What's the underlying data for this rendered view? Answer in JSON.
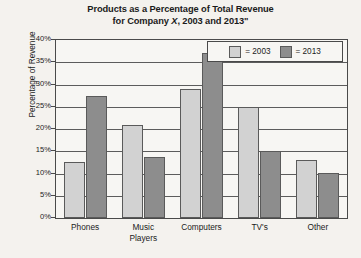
{
  "chart_data": {
    "type": "bar",
    "title": "Products as a Percentage of Total Revenue for Company X, 2003 and 2013\"",
    "title_line1": "Products as a Percentage of Total Revenue",
    "title_line2_prefix": "for Company ",
    "title_line2_italic": "X",
    "title_line2_suffix": ", 2003 and 2013\"",
    "xlabel": "",
    "ylabel": "Percentage of Revenue",
    "ylim": [
      0,
      40
    ],
    "ytick_labels": [
      "40%",
      "35%",
      "30%",
      "25%",
      "20%",
      "15%",
      "10%",
      "5%",
      "0%"
    ],
    "ytick_values": [
      40,
      35,
      30,
      25,
      20,
      15,
      10,
      5,
      0
    ],
    "grid": true,
    "grid_axis": "y",
    "legend_position": "top-right",
    "categories": [
      "Phones",
      "Music Players",
      "Computers",
      "TV's",
      "Other"
    ],
    "category_lines": [
      [
        "Phones"
      ],
      [
        "Music",
        "Players"
      ],
      [
        "Computers"
      ],
      [
        "TV's"
      ],
      [
        "Other"
      ]
    ],
    "series": [
      {
        "name": "2003",
        "legend_label": "= 2003",
        "color": "#d2d2d2",
        "values": [
          12.5,
          21.0,
          29.0,
          25.0,
          13.0
        ]
      },
      {
        "name": "2013",
        "legend_label": "= 2013",
        "color": "#8d8d8d",
        "values": [
          27.5,
          13.8,
          37.0,
          15.0,
          10.2
        ]
      }
    ]
  },
  "colors": {
    "series_2003": "#d2d2d2",
    "series_2013": "#8d8d8d",
    "axis": "#4a4a4a",
    "gridline": "#5c5c5c",
    "background": "#f4f2ee",
    "plot_background": "#f7f6f3",
    "text": "#1b1b1b"
  }
}
